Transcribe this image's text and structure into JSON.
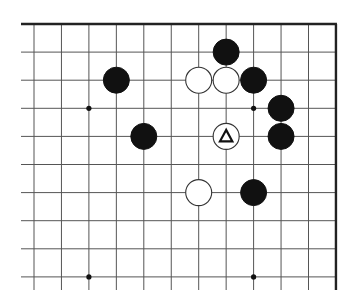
{
  "diagram": {
    "type": "go-board-fragment",
    "visible_columns": 12,
    "visible_rows": 10,
    "edges": {
      "top": true,
      "right": true,
      "left": false,
      "bottom": false
    },
    "colors": {
      "background": "#ffffff",
      "grid": "#555555",
      "edge": "#222222",
      "black_stone": "#111111",
      "white_stone": "#ffffff"
    },
    "star_points": [
      {
        "col": 2,
        "row": 3
      },
      {
        "col": 8,
        "row": 3
      },
      {
        "col": 2,
        "row": 9
      },
      {
        "col": 8,
        "row": 9
      }
    ],
    "stones": [
      {
        "color": "black",
        "col": 7,
        "row": 1
      },
      {
        "color": "black",
        "col": 3,
        "row": 2
      },
      {
        "color": "white",
        "col": 6,
        "row": 2
      },
      {
        "color": "white",
        "col": 7,
        "row": 2
      },
      {
        "color": "black",
        "col": 8,
        "row": 2
      },
      {
        "color": "black",
        "col": 9,
        "row": 3
      },
      {
        "color": "black",
        "col": 4,
        "row": 4
      },
      {
        "color": "white",
        "col": 7,
        "row": 4,
        "marker": "triangle"
      },
      {
        "color": "black",
        "col": 9,
        "row": 4
      },
      {
        "color": "white",
        "col": 6,
        "row": 6
      },
      {
        "color": "black",
        "col": 8,
        "row": 6
      }
    ]
  }
}
